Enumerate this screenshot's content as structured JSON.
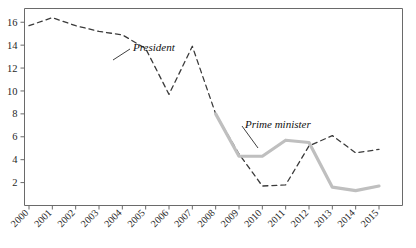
{
  "chart_data": {
    "type": "line",
    "title": "",
    "subtitle": "",
    "xlabel": "",
    "ylabel": "",
    "x": [
      2000,
      2001,
      2002,
      2003,
      2004,
      2005,
      2006,
      2007,
      2008,
      2009,
      2010,
      2011,
      2012,
      2013,
      2014,
      2015
    ],
    "categories": [
      "2000",
      "2001",
      "2002",
      "2003",
      "2004",
      "2005",
      "2006",
      "2007",
      "2008",
      "2009",
      "2010",
      "2011",
      "2012",
      "2013",
      "2014",
      "2015"
    ],
    "xlim": [
      2000,
      2015
    ],
    "ylim": [
      0,
      17.2
    ],
    "yticks": [
      2,
      4,
      6,
      8,
      10,
      12,
      14,
      16
    ],
    "ytick_labels": [
      "2",
      "4",
      "6",
      "8",
      "10",
      "12",
      "14",
      "16"
    ],
    "grid": false,
    "legend_position": "inline-annotation",
    "series": [
      {
        "name": "President",
        "style": "dashed",
        "color": "#3a3a3a",
        "x": [
          2000,
          2001,
          2002,
          2003,
          2004,
          2005,
          2006,
          2007,
          2008,
          2009,
          2010,
          2011,
          2012,
          2013,
          2014,
          2015
        ],
        "values": [
          15.7,
          16.4,
          15.7,
          15.2,
          14.9,
          13.7,
          9.7,
          13.9,
          8.0,
          4.5,
          1.7,
          1.8,
          5.2,
          6.1,
          4.6,
          4.9
        ]
      },
      {
        "name": "Prime minister",
        "style": "solid",
        "color": "#bfbfbf",
        "x": [
          2008,
          2009,
          2010,
          2011,
          2012,
          2013,
          2014,
          2015
        ],
        "values": [
          8.0,
          4.3,
          4.3,
          5.7,
          5.5,
          1.6,
          1.3,
          1.7
        ]
      }
    ],
    "annotations": [
      {
        "label": "President",
        "x_px": 133,
        "y_px": 47,
        "leader_to_x_px": 113,
        "leader_to_y_px": 60
      },
      {
        "label": "Prime minister",
        "x_px": 245,
        "y_px": 124,
        "leader_to_x_px": 258,
        "leader_to_y_px": 148
      }
    ]
  },
  "axis": {
    "y_tick_labels": [
      "16",
      "14",
      "12",
      "10",
      "8",
      "6",
      "4",
      "2"
    ],
    "x_tick_labels": [
      "2000",
      "2001",
      "2002",
      "2003",
      "2004",
      "2005",
      "2006",
      "2007",
      "2008",
      "2009",
      "2010",
      "2011",
      "2012",
      "2013",
      "2014",
      "2015"
    ]
  },
  "colors": {
    "president_line": "#3a3a3a",
    "prime_minister_line": "#bfbfbf",
    "frame": "#6a6a6a",
    "text": "#1c1c1c"
  }
}
